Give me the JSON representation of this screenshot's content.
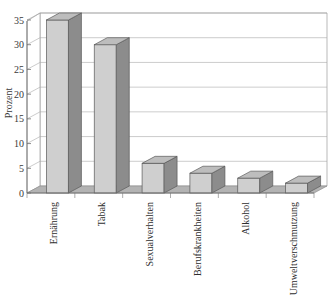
{
  "chart_data": {
    "type": "bar",
    "title": "",
    "subtitle": "",
    "xlabel": "",
    "ylabel": "Prozent",
    "ylim": [
      0,
      35
    ],
    "ytick_step": 5,
    "yticks": [
      "0",
      "5",
      "10",
      "15",
      "20",
      "25",
      "30",
      "35"
    ],
    "grid": true,
    "legend": false,
    "legend_position": "none",
    "three_d": true,
    "categories": [
      "Ernährung",
      "Tabak",
      "Sexualverhalten",
      "Berufskrankheiten",
      "Alkohol",
      "Umweltverschmutzung"
    ],
    "values": [
      35,
      30,
      6,
      4,
      3,
      2
    ],
    "series": [
      {
        "name": "Prozent",
        "values": [
          35,
          30,
          6,
          4,
          3,
          2
        ]
      }
    ],
    "colors": {
      "bar_front": "#cfcfcf",
      "bar_side": "#8c8c8c",
      "bar_top": "#bdbdbd",
      "bar_outline": "#5a5a5a",
      "floor": "#b3b3b3",
      "wall": "#ffffff",
      "grid": "#a9a9a9",
      "axis": "#707070",
      "text": "#2e2e2e",
      "background": "#ffffff"
    }
  }
}
